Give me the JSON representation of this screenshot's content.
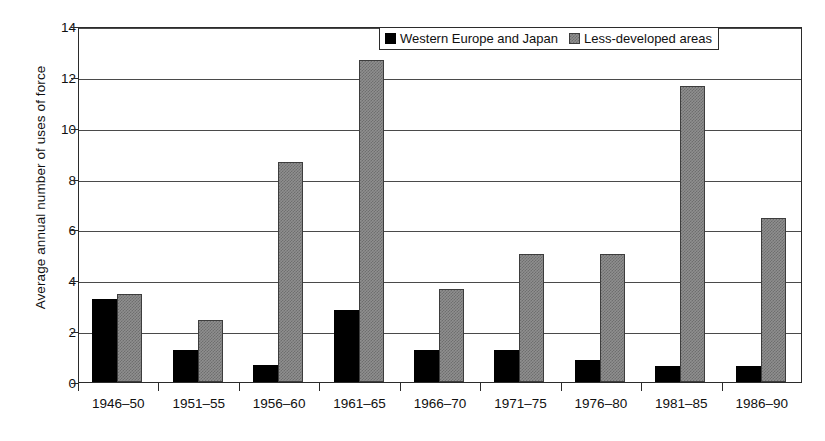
{
  "chart_data": {
    "type": "bar",
    "title": "",
    "xlabel": "",
    "ylabel": "Average annual number of uses of force",
    "ylim": [
      0,
      14
    ],
    "ytick_step": 2,
    "yticks": [
      "0",
      "2",
      "4",
      "6",
      "8",
      "10",
      "12",
      "14"
    ],
    "grid": true,
    "legend_position": "top-center-inside",
    "categories": [
      "1946–50",
      "1951–55",
      "1956–60",
      "1961–65",
      "1966–70",
      "1971–75",
      "1976–80",
      "1981–85",
      "1986–90"
    ],
    "series": [
      {
        "name": "Western Europe and Japan",
        "color": "#000000",
        "values": [
          3.25,
          1.25,
          0.65,
          2.85,
          1.25,
          1.25,
          0.85,
          0.62,
          0.62
        ]
      },
      {
        "name": "Less-developed areas",
        "color": "#8f8f8f",
        "values": [
          3.45,
          2.45,
          8.65,
          12.65,
          3.65,
          5.05,
          5.05,
          11.65,
          6.45
        ]
      }
    ]
  },
  "legend": {
    "items": [
      {
        "label": "Western Europe and Japan",
        "swatch": "black"
      },
      {
        "label": "Less-developed areas",
        "swatch": "gray"
      }
    ]
  }
}
